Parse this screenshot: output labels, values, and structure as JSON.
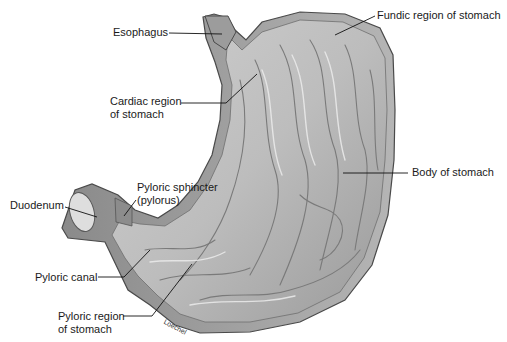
{
  "figure": {
    "style": "grayscale anatomical illustration",
    "signature": "Loechel"
  },
  "labels": [
    {
      "id": "esophagus",
      "text": "Esophagus"
    },
    {
      "id": "fundic",
      "text": "Fundic region of stomach"
    },
    {
      "id": "cardiac",
      "lines": [
        "Cardiac region",
        "of stomach"
      ]
    },
    {
      "id": "body",
      "text": "Body of stomach"
    },
    {
      "id": "pyloric-sphincter",
      "lines": [
        "Pyloric sphincter",
        "(pylorus)"
      ]
    },
    {
      "id": "duodenum",
      "text": "Duodenum"
    },
    {
      "id": "pyloric-canal",
      "text": "Pyloric canal"
    },
    {
      "id": "pyloric-region",
      "lines": [
        "Pyloric region",
        "of stomach"
      ]
    }
  ],
  "colors": {
    "background": "#ffffff",
    "tissue_light": "#d9d9d9",
    "tissue_mid": "#a8a8a8",
    "tissue_dark": "#6e6e6e",
    "outline": "#4a4a4a",
    "leader_line": "#111111",
    "text": "#1a1a1a"
  }
}
